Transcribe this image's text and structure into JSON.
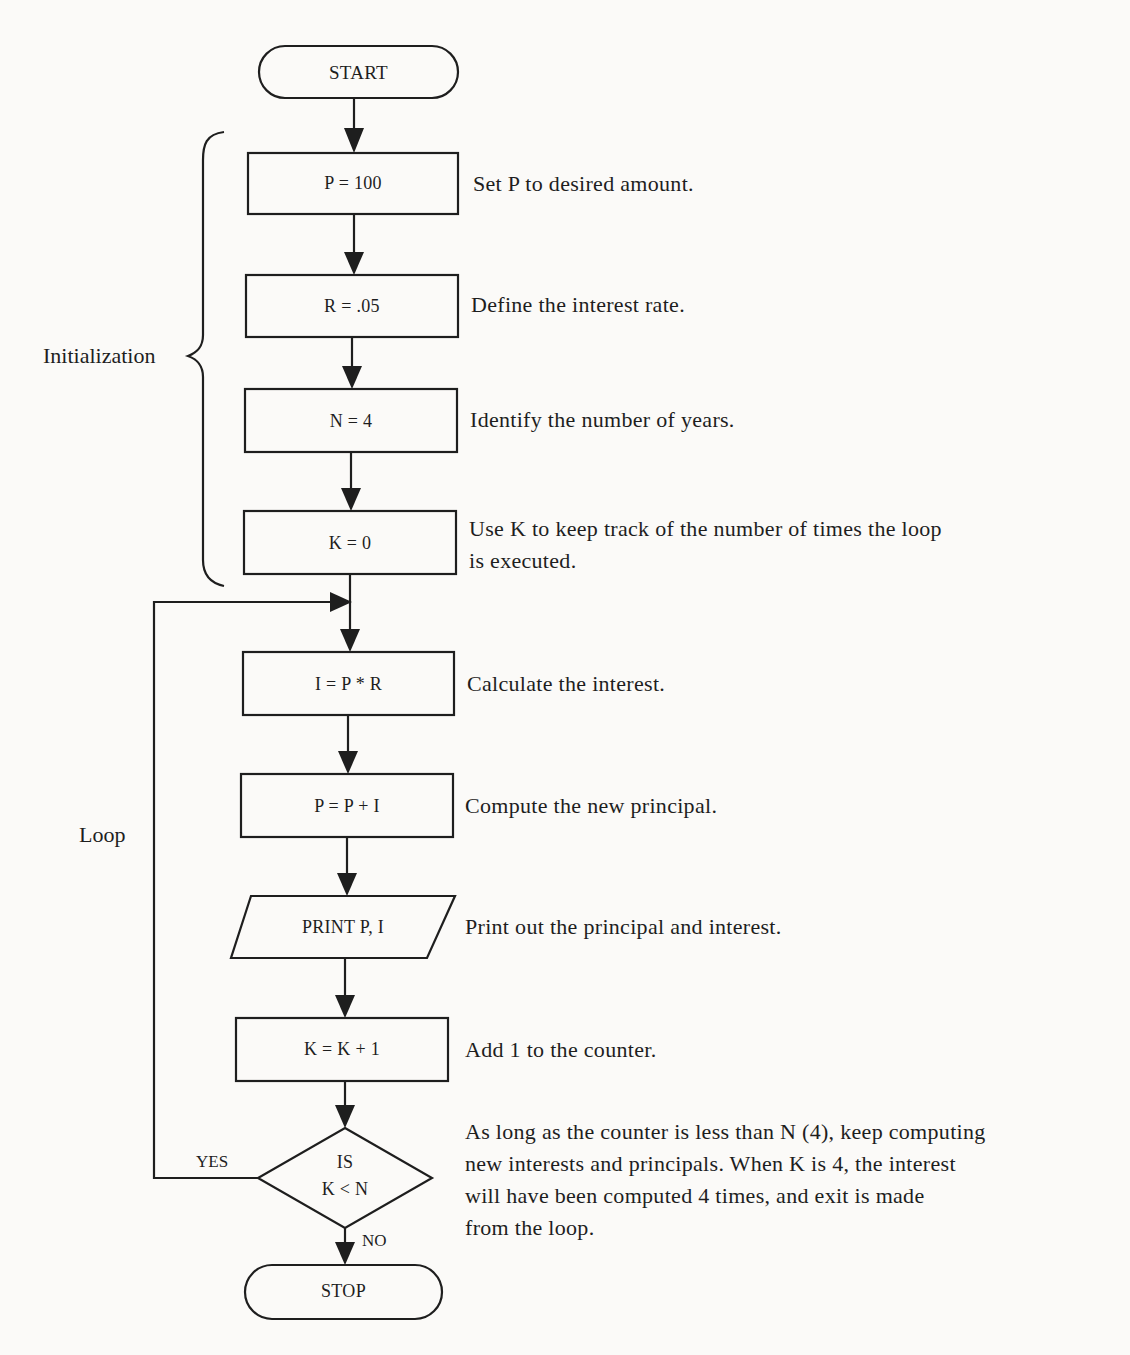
{
  "flowchart": {
    "nodes": [
      {
        "id": "start",
        "shape": "terminal",
        "label": "START"
      },
      {
        "id": "set_p",
        "shape": "process",
        "label": "P = 100",
        "note": "Set P to desired amount."
      },
      {
        "id": "set_r",
        "shape": "process",
        "label": "R = .05",
        "note": "Define the interest rate."
      },
      {
        "id": "set_n",
        "shape": "process",
        "label": "N = 4",
        "note": "Identify the number of years."
      },
      {
        "id": "set_k",
        "shape": "process",
        "label": "K = 0",
        "note_lines": [
          "Use K to keep track of the number of times the loop",
          "is executed."
        ]
      },
      {
        "id": "calc_i",
        "shape": "process",
        "label": "I = P * R",
        "note": "Calculate the interest."
      },
      {
        "id": "calc_p",
        "shape": "process",
        "label": "P = P + I",
        "note": "Compute the new principal."
      },
      {
        "id": "print",
        "shape": "io",
        "label": "PRINT P, I",
        "note": "Print out the principal and interest."
      },
      {
        "id": "inc_k",
        "shape": "process",
        "label": "K = K + 1",
        "note": "Add 1 to the counter."
      },
      {
        "id": "decision",
        "shape": "decision",
        "label_lines": [
          "IS",
          "K < N"
        ],
        "note_lines": [
          "As long as the counter is less than N (4), keep computing",
          "new interests and principals. When K is 4, the interest",
          "will have been computed 4 times, and exit is made",
          "from the loop."
        ]
      },
      {
        "id": "stop",
        "shape": "terminal",
        "label": "STOP"
      }
    ],
    "branches": {
      "yes": "YES",
      "no": "NO"
    },
    "groups": {
      "initialization": "Initialization",
      "loop": "Loop"
    }
  }
}
